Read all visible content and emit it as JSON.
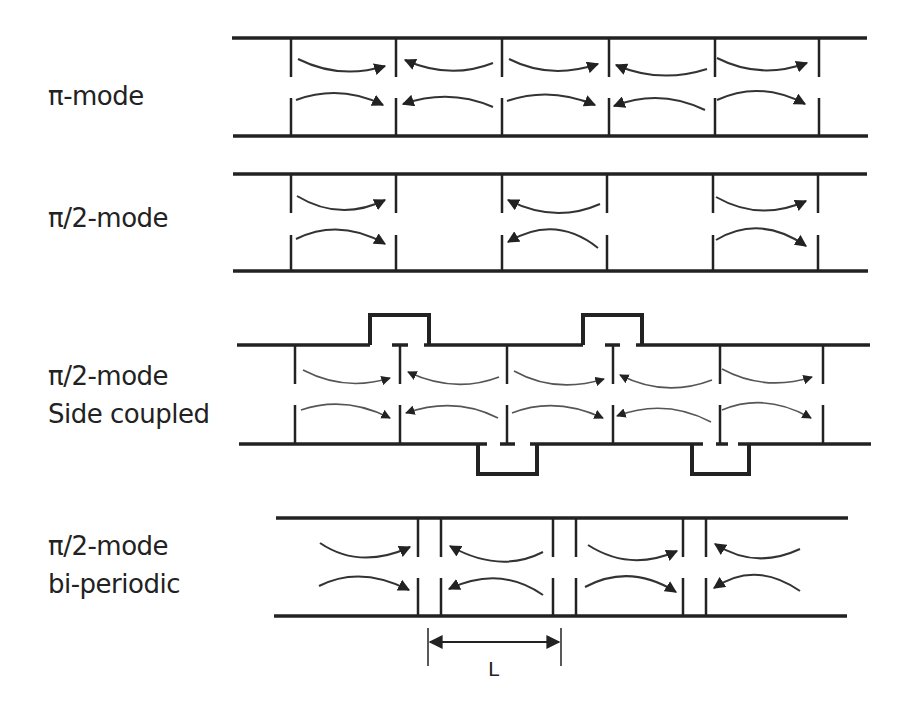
{
  "diagram": {
    "panels": [
      {
        "id": "pi-mode",
        "label_lines": [
          "π-mode"
        ]
      },
      {
        "id": "pi2-mode",
        "label_lines": [
          "π/2-mode"
        ]
      },
      {
        "id": "pi2-side-coupled",
        "label_lines": [
          "π/2-mode",
          "Side coupled"
        ]
      },
      {
        "id": "pi2-bi-periodic",
        "label_lines": [
          "π/2-mode",
          "bi-periodic"
        ]
      }
    ],
    "dimension_label": "L",
    "colors": {
      "line": "#222222",
      "background": "#ffffff"
    }
  }
}
